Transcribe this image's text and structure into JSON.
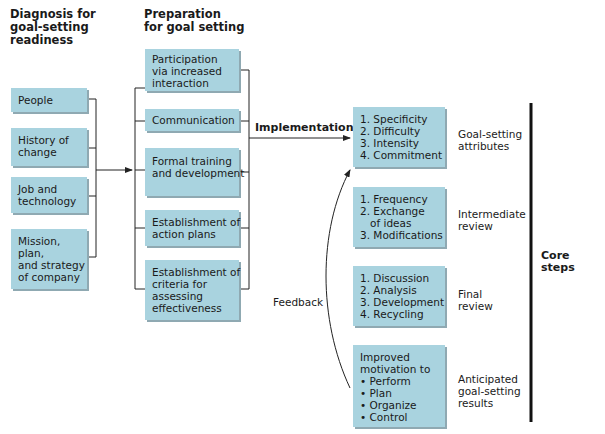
{
  "headers": {
    "diagnosis": [
      "Diagnosis for",
      "goal-setting",
      "readiness"
    ],
    "preparation": [
      "Preparation",
      "for goal setting"
    ]
  },
  "diagnosis_boxes": [
    {
      "lines": [
        "People"
      ]
    },
    {
      "lines": [
        "History of",
        "change"
      ]
    },
    {
      "lines": [
        "Job and",
        "technology"
      ]
    },
    {
      "lines": [
        "Mission,",
        "plan,",
        "and strategy",
        "of company"
      ]
    }
  ],
  "preparation_boxes": [
    {
      "lines": [
        "Participation",
        "via increased",
        "interaction"
      ]
    },
    {
      "lines": [
        "Communication"
      ]
    },
    {
      "lines": [
        "Formal training",
        "and development"
      ]
    },
    {
      "lines": [
        "Establishment of",
        "action plans"
      ]
    },
    {
      "lines": [
        "Establishment of",
        "criteria for",
        "assessing",
        "effectiveness"
      ]
    }
  ],
  "implementation_label": "Implementation",
  "feedback_label": "Feedback",
  "core_boxes": [
    {
      "lines": [
        "1. Specificity",
        "2. Difficulty",
        "3. Intensity",
        "4. Commitment"
      ],
      "label": [
        "Goal-setting",
        "attributes"
      ]
    },
    {
      "lines": [
        "1. Frequency",
        "2. Exchange",
        "    of ideas",
        "3. Modifications"
      ],
      "label": [
        "Intermediate",
        "review"
      ]
    },
    {
      "lines": [
        "1. Discussion",
        "2. Analysis",
        "3. Development",
        "4. Recycling"
      ],
      "label": [
        "Final",
        "review"
      ]
    },
    {
      "lines": [
        "Improved",
        "motivation to",
        "• Perform",
        "• Plan",
        "• Organize",
        "• Control"
      ],
      "label": [
        "Anticipated",
        "goal-setting",
        "results"
      ]
    }
  ],
  "core_steps_label": "Core steps",
  "colors": {
    "box_fill": "#a9d3df",
    "box_shadow": "#8fa9b2",
    "line": "#222222"
  }
}
